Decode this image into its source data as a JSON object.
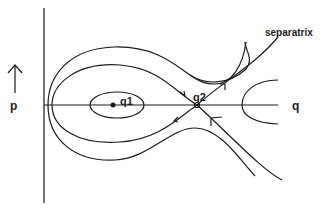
{
  "diagram": {
    "type": "phase-portrait",
    "axes": {
      "horizontal_label": "q",
      "vertical_label": "p",
      "vertical_direction_icon": "up-arrow-icon"
    },
    "points": [
      {
        "id": "q1",
        "label": "q1",
        "kind": "center (stable equilibrium)"
      },
      {
        "id": "q2",
        "label": "q2",
        "kind": "saddle (unstable equilibrium)"
      }
    ],
    "annotations": {
      "separatrix_label": "separatrix"
    },
    "colors": {
      "line": "#1a1a1a",
      "background": "#ffffff"
    }
  }
}
